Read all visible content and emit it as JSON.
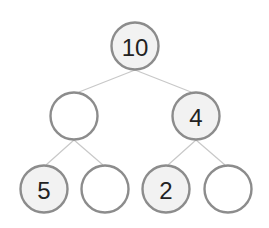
{
  "diagram": {
    "type": "binary-tree",
    "colors": {
      "filled_node": "#f2f2f2",
      "empty_node": "#ffffff",
      "stroke": "#8c8c8c",
      "edge": "#c8c8c8",
      "text": "#222222"
    },
    "nodes": [
      {
        "id": "root",
        "label": "10",
        "filled": true,
        "level": 0
      },
      {
        "id": "left",
        "label": "",
        "filled": false,
        "level": 1
      },
      {
        "id": "right",
        "label": "4",
        "filled": true,
        "level": 1
      },
      {
        "id": "left-left",
        "label": "5",
        "filled": true,
        "level": 2
      },
      {
        "id": "left-right",
        "label": "",
        "filled": false,
        "level": 2
      },
      {
        "id": "right-left",
        "label": "2",
        "filled": true,
        "level": 2
      },
      {
        "id": "right-right",
        "label": "",
        "filled": false,
        "level": 2
      }
    ],
    "edges": [
      {
        "from": "root",
        "to": "left"
      },
      {
        "from": "root",
        "to": "right"
      },
      {
        "from": "left",
        "to": "left-left"
      },
      {
        "from": "left",
        "to": "left-right"
      },
      {
        "from": "right",
        "to": "right-left"
      },
      {
        "from": "right",
        "to": "right-right"
      }
    ]
  }
}
